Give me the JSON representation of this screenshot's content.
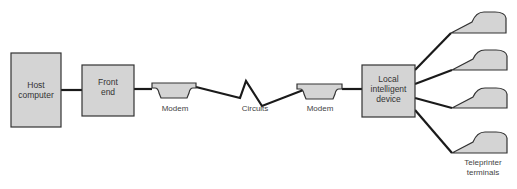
{
  "diagram": {
    "nodes": [
      {
        "id": "host",
        "label_lines": [
          "Host",
          "computer"
        ]
      },
      {
        "id": "front_end",
        "label_lines": [
          "Front",
          "end"
        ]
      },
      {
        "id": "modem1",
        "label": "Modem"
      },
      {
        "id": "circuits",
        "label": "Circuits"
      },
      {
        "id": "modem2",
        "label": "Modem"
      },
      {
        "id": "lid",
        "label_lines": [
          "Local",
          "intelligent",
          "device"
        ]
      },
      {
        "id": "terminals",
        "label_lines": [
          "Teleprinter",
          "terminals"
        ],
        "count": 4
      }
    ],
    "edges": [
      [
        "host",
        "front_end"
      ],
      [
        "front_end",
        "modem1"
      ],
      [
        "modem1",
        "circuits"
      ],
      [
        "circuits",
        "modem2"
      ],
      [
        "modem2",
        "lid"
      ],
      [
        "lid",
        "terminal1"
      ],
      [
        "lid",
        "terminal2"
      ],
      [
        "lid",
        "terminal3"
      ],
      [
        "lid",
        "terminal4"
      ]
    ],
    "colors": {
      "box_fill": "#d4d4d4",
      "stroke": "#222222",
      "text": "#444444"
    }
  }
}
